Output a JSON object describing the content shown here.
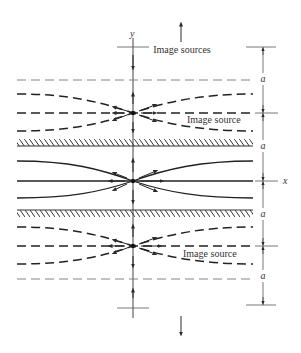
{
  "figure": {
    "labels": {
      "y_axis": "y",
      "x_axis": "x",
      "image_sources": "Image sources",
      "image_source_upper": "Image source",
      "image_source_lower": "Image source",
      "a1": "a",
      "a2": "a",
      "a3": "a",
      "a4": "a"
    },
    "colors": {
      "line": "#2a2a2a",
      "thin_line": "#555555",
      "background": "#ffffff"
    },
    "geometry": {
      "axis_x": 133,
      "center_y": 181,
      "upper_source_y": 113,
      "lower_source_y": 246,
      "upper_wall_y": 146,
      "lower_wall_y": 212,
      "upper_boundary_y": 80,
      "lower_boundary_y": 279
    }
  }
}
